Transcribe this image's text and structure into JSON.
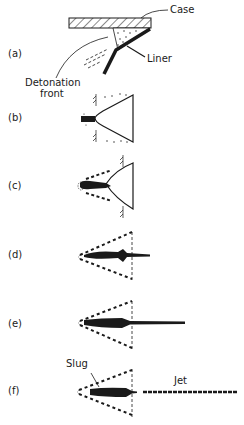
{
  "diagram": {
    "type": "shaped-charge jet formation sequence",
    "colors": {
      "ink": "#1a1a1a",
      "background": "#ffffff"
    },
    "labels": {
      "case": "Case",
      "liner": "Liner",
      "detonation_front": "Detonation\nfront",
      "detonation_front_line1": "Detonation",
      "detonation_front_line2": "front",
      "slug": "Slug",
      "jet": "Jet"
    },
    "stages": [
      {
        "id": "a",
        "label": "(a)"
      },
      {
        "id": "b",
        "label": "(b)"
      },
      {
        "id": "c",
        "label": "(c)"
      },
      {
        "id": "d",
        "label": "(d)"
      },
      {
        "id": "e",
        "label": "(e)"
      },
      {
        "id": "f",
        "label": "(f)"
      }
    ]
  }
}
